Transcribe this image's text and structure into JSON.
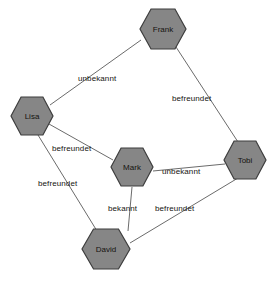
{
  "diagram": {
    "background_color": "#ffffff",
    "node_fill_color": "#868686",
    "node_stroke_color": "#3d3d3d",
    "edge_color": "#6b6b6b",
    "text_color": "#15130f",
    "node_shape": "hexagon"
  },
  "nodes": [
    {
      "id": "frank",
      "label": "Frank",
      "cx": 163,
      "cy": 29,
      "rx": 23,
      "ry": 20
    },
    {
      "id": "lisa",
      "label": "Lisa",
      "cx": 32,
      "cy": 116,
      "rx": 21,
      "ry": 19
    },
    {
      "id": "tobi",
      "label": "Tobi",
      "cx": 245,
      "cy": 160,
      "rx": 21,
      "ry": 19
    },
    {
      "id": "mark",
      "label": "Mark",
      "cx": 132,
      "cy": 167,
      "rx": 21,
      "ry": 19
    },
    {
      "id": "david",
      "label": "David",
      "cx": 106,
      "cy": 249,
      "rx": 24,
      "ry": 20
    }
  ],
  "edges": [
    {
      "id": "lisa-frank",
      "from": "Lisa",
      "to": "Frank",
      "label": "unbekannt",
      "label_x": 78,
      "label_y": 74
    },
    {
      "id": "frank-tobi",
      "from": "Frank",
      "to": "Tobi",
      "label": "befreundet",
      "label_x": 172,
      "label_y": 94
    },
    {
      "id": "lisa-mark",
      "from": "Lisa",
      "to": "Mark",
      "label": "befreundet",
      "label_x": 52,
      "label_y": 144
    },
    {
      "id": "lisa-david",
      "from": "Lisa",
      "to": "David",
      "label": "befreundet",
      "label_x": 38,
      "label_y": 179
    },
    {
      "id": "mark-tobi",
      "from": "Mark",
      "to": "Tobi",
      "label": "unbekannt",
      "label_x": 162,
      "label_y": 167
    },
    {
      "id": "mark-david",
      "from": "Mark",
      "to": "David",
      "label": "bekannt",
      "label_x": 108,
      "label_y": 204
    },
    {
      "id": "tobi-david",
      "from": "Tobi",
      "to": "David",
      "label": "befreundet",
      "label_x": 155,
      "label_y": 204
    }
  ],
  "edge_paths": {
    "lisa-frank": "M 50 105 L 141 40",
    "frank-tobi": "M 176 47 L 238 142",
    "lisa-mark": "M 49 124 L 113 160",
    "lisa-david": "M 38 135 L 97 231",
    "mark-tobi": "M 153 171 L 225 164",
    "mark-david": "M 132 187 L 128 231",
    "tobi-david": "M 238 178 L 130 243"
  }
}
